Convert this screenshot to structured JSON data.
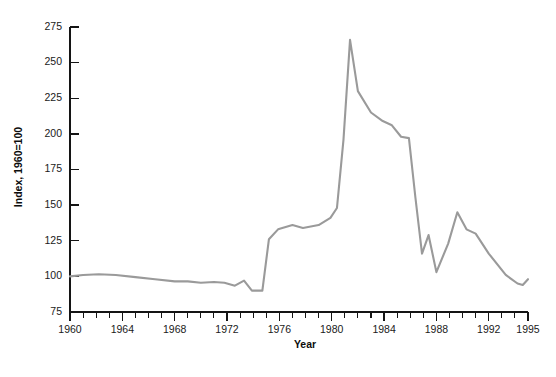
{
  "chart_data": {
    "type": "line",
    "title": "",
    "subtitle": "",
    "xlabel": "Year",
    "ylabel": "Index, 1960=100",
    "xlim": [
      1960,
      1995
    ],
    "ylim": [
      75,
      275
    ],
    "grid": false,
    "legend": null,
    "line_color": "#9a9a9a",
    "axis_color": "#141414",
    "x_tick_labels": [
      "1960",
      "1964",
      "1968",
      "1972",
      "1976",
      "1980",
      "1984",
      "1988",
      "1992",
      "1995"
    ],
    "x_tick_values": [
      1960,
      1964,
      1968,
      1972,
      1976,
      1980,
      1984,
      1988,
      1992,
      1995
    ],
    "x_minor_step": 1,
    "y_tick_labels": [
      "75",
      "100",
      "125",
      "150",
      "175",
      "200",
      "225",
      "250",
      "275"
    ],
    "y_tick_values": [
      75,
      100,
      125,
      150,
      175,
      200,
      225,
      250,
      275
    ],
    "x": [
      1960,
      1961,
      1962,
      1963,
      1964,
      1965,
      1966,
      1967,
      1968,
      1969,
      1970,
      1971,
      1972,
      1973,
      1974,
      1975,
      1976,
      1977,
      1978,
      1979,
      1980,
      1981,
      1982,
      1983,
      1984,
      1985,
      1986,
      1987,
      1988,
      1989,
      1990,
      1991,
      1992,
      1993,
      1994,
      1995
    ],
    "y": [
      100,
      101,
      102,
      102,
      101,
      100,
      99,
      98,
      97,
      97,
      96,
      97,
      96,
      94,
      99,
      95,
      93,
      92,
      92,
      102,
      92,
      98,
      95,
      90,
      100,
      98,
      94,
      95,
      101,
      99,
      97,
      96,
      95,
      94,
      93,
      98
    ],
    "series": [
      {
        "name": "Index, 1960=100",
        "color": "#9a9a9a",
        "points": [
          [
            1960.0,
            100
          ],
          [
            1961.0,
            101
          ],
          [
            1962.2,
            101.5
          ],
          [
            1963.5,
            101
          ],
          [
            1965.0,
            99.5
          ],
          [
            1966.5,
            98
          ],
          [
            1968.0,
            96.5
          ],
          [
            1969.0,
            96.5
          ],
          [
            1970.0,
            95.5
          ],
          [
            1971.0,
            96
          ],
          [
            1971.8,
            95.5
          ],
          [
            1972.6,
            93.5
          ],
          [
            1973.3,
            97
          ],
          [
            1973.9,
            90
          ],
          [
            1974.7,
            90
          ],
          [
            1975.2,
            126
          ],
          [
            1975.9,
            133
          ],
          [
            1977.0,
            136
          ],
          [
            1977.8,
            134
          ],
          [
            1979.0,
            136
          ],
          [
            1979.9,
            141
          ],
          [
            1980.4,
            148
          ],
          [
            1980.9,
            196
          ],
          [
            1981.4,
            266
          ],
          [
            1982.0,
            230
          ],
          [
            1983.0,
            215
          ],
          [
            1983.9,
            209
          ],
          [
            1984.6,
            206
          ],
          [
            1985.3,
            198
          ],
          [
            1985.9,
            197
          ],
          [
            1986.4,
            155
          ],
          [
            1986.9,
            116
          ],
          [
            1987.4,
            129
          ],
          [
            1988.0,
            103
          ],
          [
            1988.9,
            123
          ],
          [
            1989.6,
            145
          ],
          [
            1990.3,
            133
          ],
          [
            1991.0,
            130
          ],
          [
            1992.0,
            116
          ],
          [
            1993.3,
            101
          ],
          [
            1994.2,
            95
          ],
          [
            1994.6,
            94
          ],
          [
            1995.0,
            98
          ]
        ]
      }
    ]
  },
  "axes": {
    "y_axis_title": "Index, 1960=100",
    "x_axis_title": "Year"
  }
}
